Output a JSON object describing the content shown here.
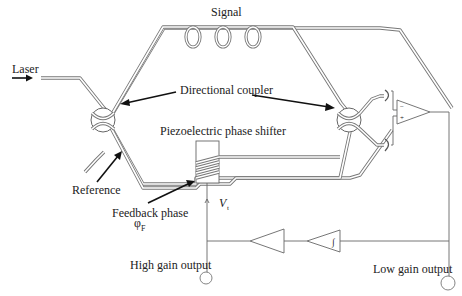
{
  "diagram": {
    "labels": {
      "laser": "Laser",
      "signal": "Signal",
      "directional_coupler": "Directional coupler",
      "piezo": "Piezoelectric phase shifter",
      "reference": "Reference",
      "feedback_phase": "Feedback phase",
      "phi": "φ",
      "phi_sub": "F",
      "v": "V",
      "v_sub": "t",
      "high_gain": "High gain output",
      "low_gain": "Low gain output",
      "integrator_mark": "∫",
      "opamp_minus": "−",
      "opamp_plus": "+"
    },
    "components": [
      {
        "id": "laser-input",
        "type": "source"
      },
      {
        "id": "coupler-left",
        "type": "directional-coupler"
      },
      {
        "id": "coupler-right",
        "type": "directional-coupler"
      },
      {
        "id": "signal-arm-coils",
        "type": "fiber-coil",
        "count": 4
      },
      {
        "id": "piezo-phase-shifter",
        "type": "phase-shifter",
        "windings": 4
      },
      {
        "id": "photodetector-top",
        "type": "photodetector"
      },
      {
        "id": "photodetector-bottom",
        "type": "photodetector"
      },
      {
        "id": "differential-amplifier",
        "type": "op-amp"
      },
      {
        "id": "integrator",
        "type": "amplifier",
        "mark": "integrator"
      },
      {
        "id": "gain-amplifier",
        "type": "amplifier"
      },
      {
        "id": "high-gain-terminal",
        "type": "output"
      },
      {
        "id": "low-gain-terminal",
        "type": "output"
      }
    ]
  }
}
